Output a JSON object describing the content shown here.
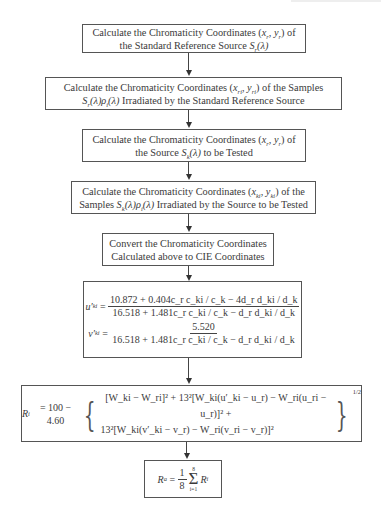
{
  "diagram": {
    "type": "flowchart",
    "direction": "top-to-bottom",
    "steps": [
      {
        "id": "step1",
        "line1_prefix": "Calculate the Chromaticity Coordinates (",
        "line1_var": "x",
        "line1_sub": "r",
        "line1_var2": "y",
        "line1_sub2": "r",
        "line1_suffix": ") of",
        "line2_prefix": "the Standard Reference Source ",
        "line2_func": "S",
        "line2_func_sub": "r",
        "line2_arg": "(λ)"
      },
      {
        "id": "step2",
        "line1_prefix": "Calculate the Chromaticity Coordinates (",
        "line1_var": "x",
        "line1_sub": "ri",
        "line1_var2": "y",
        "line1_sub2": "ri",
        "line1_suffix": ") of the Samples",
        "line2_func": "S",
        "line2_func_sub": "r",
        "line2_arg": "(λ)",
        "line2_func2": "ρ",
        "line2_func2_sub": "i",
        "line2_arg2": "(λ)",
        "line2_suffix": " Irradiated by the Standard Reference Source"
      },
      {
        "id": "step3",
        "line1_prefix": "Calculate the Chromaticity Coordinates (",
        "line1_var": "x",
        "line1_sub": "r",
        "line1_var2": "y",
        "line1_sub2": "r",
        "line1_suffix": ") of",
        "line2_prefix": "the  Source ",
        "line2_func": "S",
        "line2_func_sub": "k",
        "line2_arg": "(λ)",
        "line2_suffix": " to be Tested"
      },
      {
        "id": "step4",
        "line1_prefix": "Calculate the Chromaticity Coordinates (",
        "line1_var": "x",
        "line1_sub": "ki",
        "line1_var2": "y",
        "line1_sub2": "ki",
        "line1_suffix": ") of the",
        "line2_prefix": "Samples ",
        "line2_func": "S",
        "line2_func_sub": "k",
        "line2_arg": "(λ)",
        "line2_func2": "ρ",
        "line2_func2_sub": "i",
        "line2_arg2": "(λ)",
        "line2_suffix": " Irradiated by the Source to be Tested"
      },
      {
        "id": "step5",
        "line1": "Convert the Chromaticity Coordinates",
        "line2": "Calculated above to CIE Coordinates"
      },
      {
        "id": "step6",
        "u_lhs": "u′",
        "u_lhs_sub": "ki",
        "u_num": "10.872 + 0.404c_r c_ki / c_k − 4d_r d_ki / d_k",
        "u_den": "16.518 + 1.481c_r c_ki / c_k − d_r d_ki / d_k",
        "v_lhs": "v′",
        "v_lhs_sub": "ki",
        "v_num": "5.520",
        "v_den": "16.518 + 1.481c_r c_ki / c_k − d_r d_ki / d_k"
      },
      {
        "id": "step7",
        "lhs": "R",
        "lhs_sub": "i",
        "rhs_const": "= 100 − 4.60",
        "row1": "[W_ki − W_ri]² + 13²[W_ki(u′_ki − u_r) − W_ri(u_ri − u_r)]² +",
        "row2": "13²[W_ki(v′_ki − v_r) − W_ri(v_ri − v_r)]²",
        "exponent": "1/2"
      },
      {
        "id": "step8",
        "lhs": "R",
        "lhs_sub": "a",
        "frac_num": "1",
        "frac_den": "8",
        "sum_upper": "8",
        "sum_lower": "i=1",
        "term": "R",
        "term_sub": "i"
      }
    ],
    "edges": [
      [
        "step1",
        "step2"
      ],
      [
        "step2",
        "step3"
      ],
      [
        "step3",
        "step4"
      ],
      [
        "step4",
        "step5"
      ],
      [
        "step5",
        "step6"
      ],
      [
        "step6",
        "step7"
      ],
      [
        "step7",
        "step8"
      ]
    ]
  }
}
